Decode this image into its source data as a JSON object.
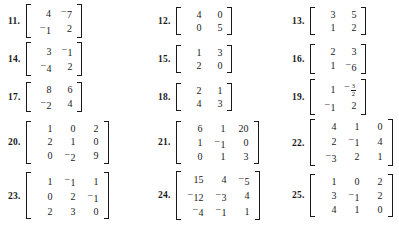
{
  "page": {
    "kind": "textbook-exercise-list",
    "columns": 3,
    "rows": 5
  },
  "exercises": [
    {
      "number": "11.",
      "size": "2x2",
      "rows": [
        [
          {
            "text": "4"
          },
          {
            "neg": true,
            "text": "7"
          }
        ],
        [
          {
            "neg": true,
            "text": "1"
          },
          {
            "text": "2"
          }
        ]
      ]
    },
    {
      "number": "12.",
      "size": "2x2",
      "rows": [
        [
          {
            "text": "4"
          },
          {
            "text": "0"
          }
        ],
        [
          {
            "text": "0"
          },
          {
            "text": "5"
          }
        ]
      ]
    },
    {
      "number": "13.",
      "size": "2x2",
      "rows": [
        [
          {
            "text": "3"
          },
          {
            "text": "5"
          }
        ],
        [
          {
            "text": "1"
          },
          {
            "text": "2"
          }
        ]
      ]
    },
    {
      "number": "14.",
      "size": "2x2",
      "rows": [
        [
          {
            "text": "3"
          },
          {
            "neg": true,
            "text": "1"
          }
        ],
        [
          {
            "neg": true,
            "text": "4"
          },
          {
            "text": "2"
          }
        ]
      ]
    },
    {
      "number": "15.",
      "size": "2x2",
      "rows": [
        [
          {
            "text": "1"
          },
          {
            "text": "3"
          }
        ],
        [
          {
            "text": "2"
          },
          {
            "text": "0"
          }
        ]
      ]
    },
    {
      "number": "16.",
      "size": "2x2",
      "rows": [
        [
          {
            "text": "2"
          },
          {
            "text": "3"
          }
        ],
        [
          {
            "text": "1"
          },
          {
            "neg": true,
            "text": "6"
          }
        ]
      ]
    },
    {
      "number": "17.",
      "size": "2x2",
      "rows": [
        [
          {
            "text": "8"
          },
          {
            "text": "6"
          }
        ],
        [
          {
            "neg": true,
            "text": "2"
          },
          {
            "text": "4"
          }
        ]
      ]
    },
    {
      "number": "18.",
      "size": "2x2",
      "rows": [
        [
          {
            "text": "2"
          },
          {
            "text": "1"
          }
        ],
        [
          {
            "text": "4"
          },
          {
            "text": "3"
          }
        ]
      ]
    },
    {
      "number": "19.",
      "size": "2x2",
      "rows": [
        [
          {
            "text": "1"
          },
          {
            "neg": true,
            "frac": {
              "num": "3",
              "den": "2"
            }
          }
        ],
        [
          {
            "neg": true,
            "text": "1"
          },
          {
            "text": "2"
          }
        ]
      ]
    },
    {
      "number": "20.",
      "size": "3x3",
      "rows": [
        [
          {
            "text": "1"
          },
          {
            "text": "0"
          },
          {
            "text": "2"
          }
        ],
        [
          {
            "text": "2"
          },
          {
            "text": "1"
          },
          {
            "text": "0"
          }
        ],
        [
          {
            "text": "0"
          },
          {
            "neg": true,
            "text": "2"
          },
          {
            "text": "9"
          }
        ]
      ]
    },
    {
      "number": "21.",
      "size": "3x3",
      "rows": [
        [
          {
            "text": "6"
          },
          {
            "text": "1"
          },
          {
            "text": "20"
          }
        ],
        [
          {
            "text": "1"
          },
          {
            "neg": true,
            "text": "1"
          },
          {
            "text": "0"
          }
        ],
        [
          {
            "text": "0"
          },
          {
            "text": "1"
          },
          {
            "text": "3"
          }
        ]
      ]
    },
    {
      "number": "22.",
      "size": "3x3",
      "rows": [
        [
          {
            "text": "4"
          },
          {
            "text": "1"
          },
          {
            "text": "0"
          }
        ],
        [
          {
            "text": "2"
          },
          {
            "neg": true,
            "text": "1"
          },
          {
            "text": "4"
          }
        ],
        [
          {
            "neg": true,
            "text": "3"
          },
          {
            "text": "2"
          },
          {
            "text": "1"
          }
        ]
      ]
    },
    {
      "number": "23.",
      "size": "3x3",
      "rows": [
        [
          {
            "text": "1"
          },
          {
            "neg": true,
            "text": "1"
          },
          {
            "text": "1"
          }
        ],
        [
          {
            "text": "0"
          },
          {
            "text": "2"
          },
          {
            "neg": true,
            "text": "1"
          }
        ],
        [
          {
            "text": "2"
          },
          {
            "text": "3"
          },
          {
            "text": "0"
          }
        ]
      ]
    },
    {
      "number": "24.",
      "size": "3x3",
      "rows": [
        [
          {
            "text": "15"
          },
          {
            "text": "4"
          },
          {
            "neg": true,
            "text": "5"
          }
        ],
        [
          {
            "neg": true,
            "text": "12"
          },
          {
            "neg": true,
            "text": "3"
          },
          {
            "text": "4"
          }
        ],
        [
          {
            "neg": true,
            "text": "4"
          },
          {
            "neg": true,
            "text": "1"
          },
          {
            "text": "1"
          }
        ]
      ]
    },
    {
      "number": "25.",
      "size": "3x3",
      "rows": [
        [
          {
            "text": "1"
          },
          {
            "text": "0"
          },
          {
            "text": "2"
          }
        ],
        [
          {
            "text": "3"
          },
          {
            "neg": true,
            "text": "1"
          },
          {
            "text": "2"
          }
        ],
        [
          {
            "text": "4"
          },
          {
            "text": "1"
          },
          {
            "text": "0"
          }
        ]
      ]
    }
  ]
}
